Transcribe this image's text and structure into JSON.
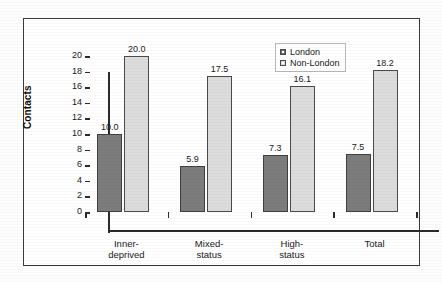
{
  "chart_data": {
    "type": "bar",
    "title": "",
    "xlabel": "",
    "ylabel": "Contacts",
    "ylim": [
      0,
      20
    ],
    "y_ticks": [
      0,
      2,
      4,
      6,
      8,
      10,
      12,
      14,
      16,
      18,
      20
    ],
    "grid": false,
    "legend_position": "top-right",
    "categories": [
      "Inner-deprived",
      "Mixed-status",
      "High-status",
      "Total"
    ],
    "category_lines": [
      [
        "Inner-",
        "deprived"
      ],
      [
        "Mixed-",
        "status"
      ],
      [
        "High-",
        "status"
      ],
      [
        "Total"
      ]
    ],
    "series": [
      {
        "name": "London",
        "color": "#7c7c7c",
        "values": [
          10.0,
          5.9,
          7.3,
          7.5
        ],
        "labels": [
          "10.0",
          "5.9",
          "7.3",
          "7.5"
        ]
      },
      {
        "name": "Non-London",
        "color": "#dcdcdc",
        "values": [
          20.0,
          17.5,
          16.1,
          18.2
        ],
        "labels": [
          "20.0",
          "17.5",
          "16.1",
          "18.2"
        ]
      }
    ]
  },
  "axis": {
    "y_title": "Contacts",
    "y_tick_labels": [
      "20",
      "18",
      "16",
      "14",
      "12",
      "10",
      "8",
      "6",
      "4",
      "2",
      "0"
    ]
  },
  "legend": {
    "items": [
      {
        "label": "London",
        "swatch": "london"
      },
      {
        "label": "Non-London",
        "swatch": "nonlondon"
      }
    ]
  }
}
